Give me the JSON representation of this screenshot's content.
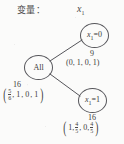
{
  "header": {
    "variable_label": "变量：",
    "variable_name": "x",
    "variable_subscript": "1"
  },
  "colors": {
    "ink": "#3b3b3b",
    "stroke": "#55555a",
    "background": "#fbfbfa"
  },
  "tree": {
    "root": {
      "node_label": "All",
      "count": "16",
      "vector_open": "(",
      "vector_close": ")",
      "terms": [
        "5/6",
        "1",
        "0",
        "1"
      ],
      "frac_num": "5",
      "frac_den": "6",
      "term2": ", 1",
      "term3": ", 0",
      "term4": ", 1"
    },
    "child_zero": {
      "node_label_var": "x",
      "node_label_sub": "1",
      "node_label_eq": "=0",
      "count": "9",
      "vector": "(0, 1, 0, 1)"
    },
    "child_one": {
      "node_label_var": "x",
      "node_label_sub": "1",
      "node_label_eq": "=1",
      "count": "16",
      "vector_open": "(",
      "vector_close": ")",
      "terms": [
        "1",
        "4/5",
        "0",
        "4/5"
      ],
      "term1": "1, ",
      "frac1_num": "4",
      "frac1_den": "5",
      "term3": ", 0, ",
      "frac2_num": "4",
      "frac2_den": "5"
    }
  },
  "edges": [
    {
      "from": "root",
      "to": "child_zero"
    },
    {
      "from": "root",
      "to": "child_one"
    }
  ]
}
